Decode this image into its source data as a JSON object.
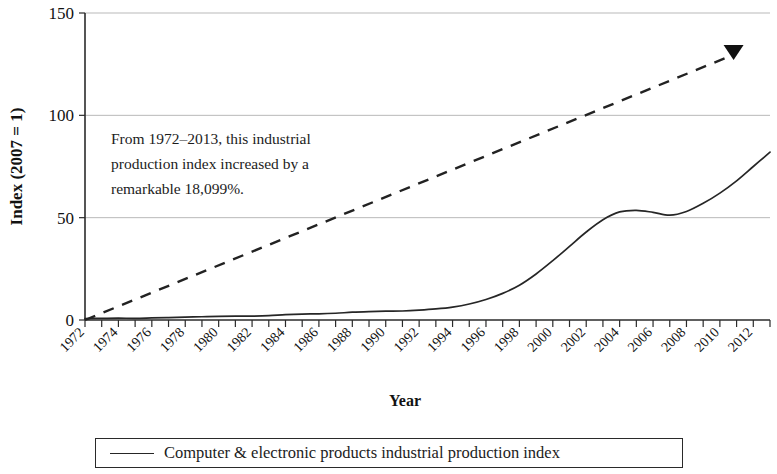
{
  "chart_data": {
    "type": "line",
    "title": "",
    "xlabel": "Year",
    "ylabel": "Index (2007 = 1)",
    "xlim": [
      1972,
      2013
    ],
    "ylim": [
      0,
      150
    ],
    "yticks": [
      0,
      50,
      100,
      150
    ],
    "grid": true,
    "legend_position": "bottom",
    "xtick_labels": [
      "1972",
      "1974",
      "1976",
      "1978",
      "1980",
      "1982",
      "1984",
      "1986",
      "1988",
      "1990",
      "1992",
      "1994",
      "1996",
      "1998",
      "2000",
      "2002",
      "2004",
      "2006",
      "2008",
      "2010",
      "2012"
    ],
    "xtick_step_years": 2,
    "minor_tick_step_years": 1,
    "annotation": "From 1972–2013, this industrial\nproduction index increased by a\nremarkable 18,099%.",
    "series": [
      {
        "name": "Computer & electronic products industrial production index",
        "style": "solid",
        "color": "#262626",
        "x": [
          1972,
          1973,
          1974,
          1975,
          1976,
          1977,
          1978,
          1979,
          1980,
          1981,
          1982,
          1983,
          1984,
          1985,
          1986,
          1987,
          1988,
          1989,
          1990,
          1991,
          1992,
          1993,
          1994,
          1995,
          1996,
          1997,
          1998,
          1999,
          2000,
          2001,
          2002,
          2003,
          2004,
          2005,
          2006,
          2007,
          2008,
          2009,
          2010,
          2011,
          2012,
          2013
        ],
        "values": [
          0.7,
          0.8,
          0.9,
          0.8,
          1.0,
          1.2,
          1.4,
          1.6,
          1.8,
          1.9,
          1.9,
          2.1,
          2.6,
          2.9,
          3.0,
          3.3,
          3.8,
          4.1,
          4.3,
          4.4,
          4.8,
          5.4,
          6.3,
          7.8,
          10.0,
          13.0,
          17.0,
          22.5,
          29.0,
          36.0,
          43.0,
          49.0,
          52.8,
          53.6,
          52.6,
          51.2,
          53.0,
          57.0,
          62.0,
          68.0,
          75.0,
          82.0
        ]
      },
      {
        "name": "Trend",
        "style": "dashed",
        "color": "#222222",
        "x": [
          1972,
          2011
        ],
        "values": [
          0,
          131
        ]
      }
    ],
    "legend": [
      {
        "label": "Computer & electronic products industrial production index",
        "style": "solid",
        "color": "#262626"
      }
    ]
  }
}
